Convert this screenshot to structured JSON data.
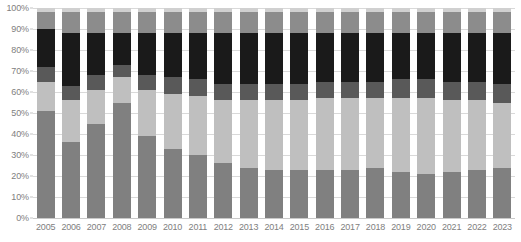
{
  "chart_data": {
    "type": "bar",
    "subtype": "stacked-percentage",
    "title": "",
    "subtitle": "",
    "xlabel": "",
    "ylabel": "",
    "ylim": [
      0,
      100
    ],
    "grid": true,
    "legend": "none",
    "categories": [
      "2005",
      "2006",
      "2007",
      "2008",
      "2009",
      "2010",
      "2011",
      "2012",
      "2013",
      "2014",
      "2015",
      "2016",
      "2017",
      "2018",
      "2019",
      "2020",
      "2021",
      "2022",
      "2023"
    ],
    "y_ticks": [
      "0%",
      "10%",
      "20%",
      "30%",
      "40%",
      "50%",
      "60%",
      "70%",
      "80%",
      "90%",
      "100%"
    ],
    "y_tick_values": [
      0,
      10,
      20,
      30,
      40,
      50,
      60,
      70,
      80,
      90,
      100
    ],
    "series": [
      {
        "name": "segment-1",
        "color": "#808080",
        "values": [
          51,
          36,
          45,
          55,
          39,
          33,
          30,
          26,
          24,
          23,
          23,
          23,
          23,
          24,
          22,
          21,
          22,
          23,
          24
        ]
      },
      {
        "name": "segment-2",
        "color": "#bfbfbf",
        "values": [
          14,
          20,
          16,
          12,
          22,
          26,
          28,
          30,
          32,
          33,
          33,
          34,
          34,
          33,
          35,
          36,
          34,
          33,
          31
        ]
      },
      {
        "name": "segment-3",
        "color": "#595959",
        "values": [
          7,
          7,
          7,
          6,
          7,
          8,
          8,
          8,
          8,
          8,
          8,
          8,
          8,
          8,
          9,
          9,
          9,
          9,
          9
        ]
      },
      {
        "name": "segment-4",
        "color": "#1a1a1a",
        "values": [
          18,
          25,
          20,
          15,
          20,
          21,
          22,
          24,
          24,
          24,
          24,
          23,
          23,
          23,
          22,
          22,
          23,
          23,
          24
        ]
      },
      {
        "name": "segment-5",
        "color": "#8c8c8c",
        "values": [
          8,
          10,
          10,
          10,
          10,
          10,
          10,
          10,
          10,
          10,
          10,
          10,
          10,
          10,
          10,
          10,
          10,
          10,
          10
        ]
      },
      {
        "name": "segment-6",
        "color": "#d0d0d0",
        "values": [
          2,
          2,
          2,
          2,
          2,
          2,
          2,
          2,
          2,
          2,
          2,
          2,
          2,
          2,
          2,
          2,
          2,
          2,
          2
        ]
      }
    ]
  },
  "axis": {
    "y_label_suffix": "%",
    "x_labels": [
      "2005",
      "2006",
      "2007",
      "2008",
      "2009",
      "2010",
      "2011",
      "2012",
      "2013",
      "2014",
      "2015",
      "2016",
      "2017",
      "2018",
      "2019",
      "2020",
      "2021",
      "2022",
      "2023"
    ]
  },
  "colors": {
    "grid": "#d9d9d9",
    "axis_text": "#808080",
    "background": "#ffffff"
  }
}
